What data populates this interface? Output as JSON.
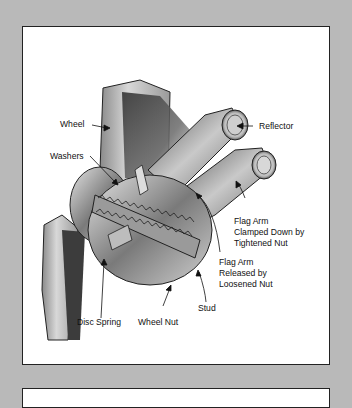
{
  "diagram": {
    "labels": {
      "wheel": "Wheel",
      "washers": "Washers",
      "reflector": "Reflector",
      "flag_clamped_1": "Flag Arm",
      "flag_clamped_2": "Clamped Down by",
      "flag_clamped_3": "Tightened Nut",
      "flag_released_1": "Flag Arm",
      "flag_released_2": "Released by",
      "flag_released_3": "Loosened Nut",
      "stud": "Stud",
      "disc_spring": "Disc Spring",
      "wheel_nut": "Wheel Nut"
    },
    "colors": {
      "background": "#b9b9b9",
      "panel": "#ffffff",
      "border": "#222222",
      "ink": "#111111"
    }
  }
}
